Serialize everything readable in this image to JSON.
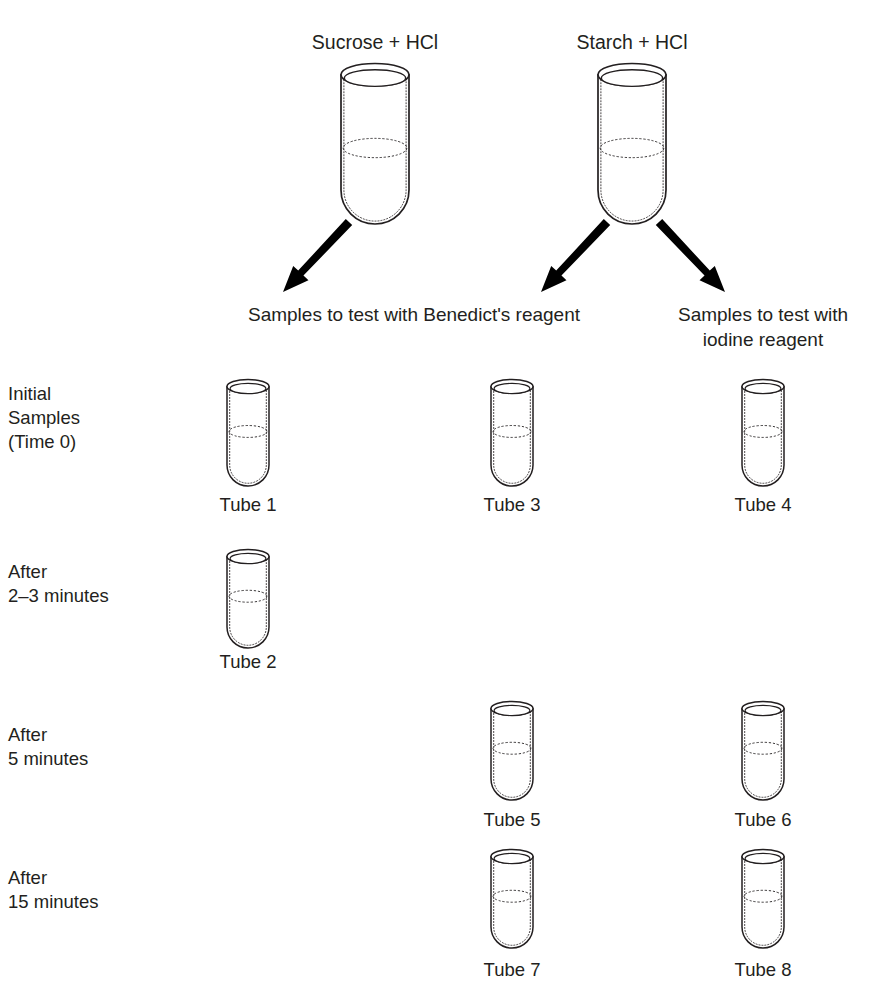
{
  "figure": {
    "kind": "laboratory-procedure-diagram",
    "background_color": "#ffffff",
    "line_color": "#231f20",
    "arrow_color": "#000000",
    "glass_fill": "#ffffff"
  },
  "sources": [
    {
      "id": "sucrose",
      "label": "Sucrose + HCl",
      "cx": 375,
      "label_y": 30,
      "tube": {
        "x": 341,
        "y": 62,
        "w": 68,
        "h": 162,
        "fill_fraction": 0.52
      }
    },
    {
      "id": "starch",
      "label": "Starch + HCl",
      "cx": 632,
      "label_y": 30,
      "tube": {
        "x": 598,
        "y": 62,
        "w": 68,
        "h": 162,
        "fill_fraction": 0.52
      }
    }
  ],
  "arrows": [
    {
      "id": "sucrose-to-benedicts",
      "from": [
        349,
        222
      ],
      "to": [
        283,
        292
      ]
    },
    {
      "id": "starch-to-benedicts",
      "from": [
        607,
        222
      ],
      "to": [
        541,
        292
      ]
    },
    {
      "id": "starch-to-iodine",
      "from": [
        659,
        222
      ],
      "to": [
        725,
        292
      ]
    }
  ],
  "flow_labels": [
    {
      "id": "benedicts-reagent-label",
      "cx": 414,
      "y": 303,
      "lines": [
        "Samples to test with Benedict's reagent"
      ]
    },
    {
      "id": "iodine-reagent-label",
      "cx": 763,
      "y": 303,
      "lines": [
        "Samples to test with",
        "iodine reagent"
      ]
    }
  ],
  "rows": [
    {
      "id": "initial-samples",
      "label_lines": [
        "Initial",
        "Samples",
        "(Time 0)"
      ],
      "label_x": 8,
      "label_y": 382,
      "tube_top": 378,
      "label_row_y": 493
    },
    {
      "id": "after-2-3-minutes",
      "label_lines": [
        "After",
        "2–3 minutes"
      ],
      "label_x": 8,
      "label_y": 560,
      "tube_top": 548,
      "label_row_y": 650
    },
    {
      "id": "after-5-minutes",
      "label_lines": [
        "After",
        "5 minutes"
      ],
      "label_x": 8,
      "label_y": 723,
      "tube_top": 700,
      "label_row_y": 808
    },
    {
      "id": "after-15-minutes",
      "label_lines": [
        "After",
        "15 minutes"
      ],
      "label_x": 8,
      "label_y": 866,
      "tube_top": 848,
      "label_row_y": 958
    }
  ],
  "columns": [
    {
      "id": "benedicts-sucrose",
      "cx": 248
    },
    {
      "id": "benedicts-starch",
      "cx": 512
    },
    {
      "id": "iodine-starch",
      "cx": 763
    }
  ],
  "tubes": [
    {
      "id": "tube-1",
      "label": "Tube 1",
      "row": "initial-samples",
      "column": "benedicts-sucrose",
      "cx": 248,
      "top": 378,
      "w": 42,
      "h": 108,
      "fill_fraction": 0.47
    },
    {
      "id": "tube-3",
      "label": "Tube 3",
      "row": "initial-samples",
      "column": "benedicts-starch",
      "cx": 512,
      "top": 378,
      "w": 42,
      "h": 108,
      "fill_fraction": 0.47
    },
    {
      "id": "tube-4",
      "label": "Tube 4",
      "row": "initial-samples",
      "column": "iodine-starch",
      "cx": 763,
      "top": 378,
      "w": 42,
      "h": 108,
      "fill_fraction": 0.47
    },
    {
      "id": "tube-2",
      "label": "Tube 2",
      "row": "after-2-3-minutes",
      "column": "benedicts-sucrose",
      "cx": 248,
      "top": 548,
      "w": 42,
      "h": 100,
      "fill_fraction": 0.45
    },
    {
      "id": "tube-5",
      "label": "Tube 5",
      "row": "after-5-minutes",
      "column": "benedicts-starch",
      "cx": 512,
      "top": 700,
      "w": 42,
      "h": 100,
      "fill_fraction": 0.45
    },
    {
      "id": "tube-6",
      "label": "Tube 6",
      "row": "after-5-minutes",
      "column": "iodine-starch",
      "cx": 763,
      "top": 700,
      "w": 42,
      "h": 100,
      "fill_fraction": 0.45
    },
    {
      "id": "tube-7",
      "label": "Tube 7",
      "row": "after-15-minutes",
      "column": "benedicts-starch",
      "cx": 512,
      "top": 848,
      "w": 42,
      "h": 100,
      "fill_fraction": 0.45
    },
    {
      "id": "tube-8",
      "label": "Tube 8",
      "row": "after-15-minutes",
      "column": "iodine-starch",
      "cx": 763,
      "top": 848,
      "w": 42,
      "h": 100,
      "fill_fraction": 0.45
    }
  ]
}
